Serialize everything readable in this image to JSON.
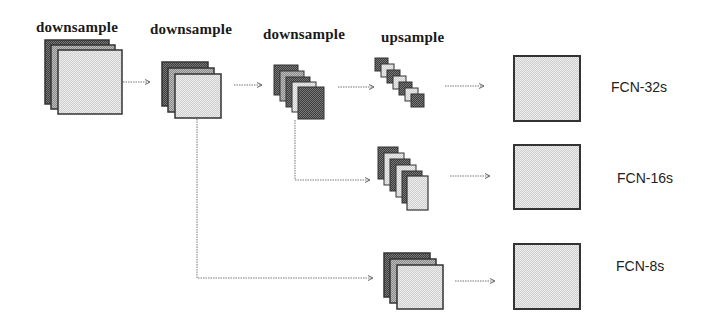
{
  "stage_labels": [
    {
      "text": "downsample",
      "x": 36,
      "y": 19
    },
    {
      "text": "downsample",
      "x": 150,
      "y": 21
    },
    {
      "text": "downsample",
      "x": 263,
      "y": 26
    },
    {
      "text": "upsample",
      "x": 381,
      "y": 29
    }
  ],
  "outputs": [
    {
      "label": "FCN-32s",
      "x": 611,
      "y": 79
    },
    {
      "label": "FCN-16s",
      "x": 617,
      "y": 170
    },
    {
      "label": "FCN-8s",
      "x": 616,
      "y": 258
    }
  ],
  "colors": {
    "dark_fill": "#555555",
    "mid_fill": "#9a9a9a",
    "light_fill": "#dcdcdc",
    "output_fill": "#d6d6d6",
    "stroke": "#333333",
    "arrow": "#777777"
  }
}
